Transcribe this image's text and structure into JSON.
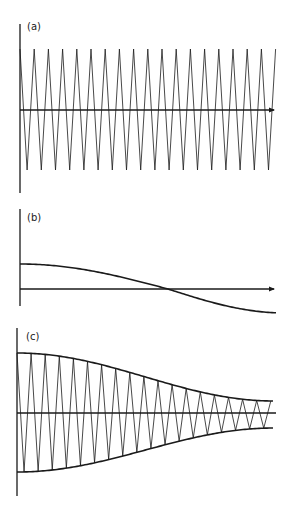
{
  "figure": {
    "background": "#ffffff",
    "ink": "#1a1a1a",
    "panels": [
      {
        "id": "a",
        "label": "(a)",
        "description": "constant-amplitude triangular carrier oscillation",
        "label_pos": [
          27,
          30
        ],
        "y_axis": {
          "x": 20,
          "y1": 24,
          "y2": 193
        },
        "x_axis": {
          "y": 110,
          "x1": 20,
          "x2": 279,
          "arrow": true
        },
        "wave": {
          "type": "triangle",
          "x_start": 20,
          "x_end": 276,
          "period": 14.2,
          "amplitude_top": 49,
          "amplitude_bottom": 170,
          "phase_start": "top"
        }
      },
      {
        "id": "b",
        "label": "(b)",
        "description": "slowly varying modulating envelope crossing zero",
        "label_pos": [
          27,
          221
        ],
        "y_axis": {
          "x": 20,
          "y1": 209,
          "y2": 306
        },
        "x_axis": {
          "y": 289,
          "x1": 20,
          "x2": 279,
          "arrow": true
        },
        "curve": {
          "type": "cosine-half",
          "x_start": 20,
          "x_end": 276,
          "y_start": 264,
          "y_zero_cross_x": 168,
          "y_end": 313
        }
      },
      {
        "id": "c",
        "label": "(c)",
        "description": "carrier modulated by envelope: amplitude decays toward right",
        "label_pos": [
          26,
          340
        ],
        "y_axis": {
          "x": 17,
          "y1": 328,
          "y2": 496
        },
        "x_axis": {
          "y": 413,
          "x1": 17,
          "x2": 276,
          "arrow": false
        },
        "envelope": {
          "upper_start": 353,
          "upper_end": 401,
          "lower_start": 472,
          "lower_end": 428,
          "x_start": 17,
          "x_end": 274
        },
        "wave": {
          "type": "triangle-modulated",
          "period": 14.1,
          "phase_start": "top"
        }
      }
    ]
  }
}
